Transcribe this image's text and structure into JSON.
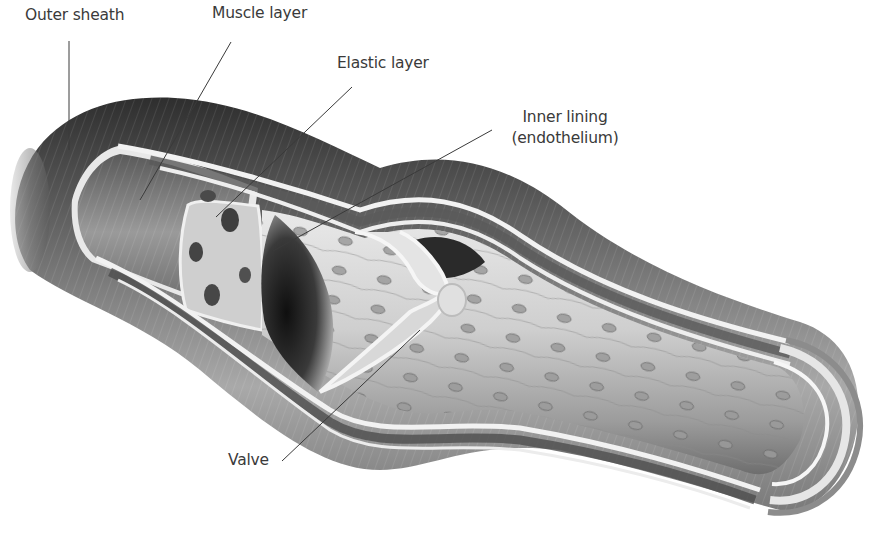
{
  "diagram": {
    "type": "anatomical-cutaway",
    "labels": {
      "outer_sheath": "Outer sheath",
      "muscle_layer": "Muscle layer",
      "elastic_layer": "Elastic layer",
      "inner_lining_line1": "Inner lining",
      "inner_lining_line2": "(endothelium)",
      "valve": "Valve"
    },
    "colors": {
      "background": "#ffffff",
      "label_text": "#3a3a3a",
      "leader_line": "#3a3a3a",
      "outer_sheath_dark": "#3c3c3c",
      "outer_sheath_light": "#b8b8b8",
      "wall_light": "#e6e6e6",
      "lumen_dark": "#1e1e1e",
      "lumen_light": "#d9d9d9"
    }
  }
}
